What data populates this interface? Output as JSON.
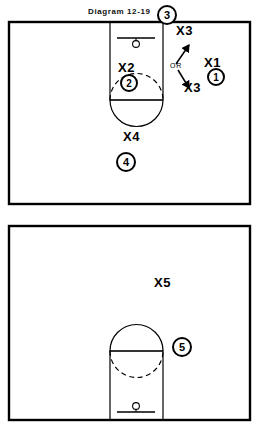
{
  "diagram": {
    "title": "Diagram 12-19",
    "type": "basketball-play-diagram",
    "court": {
      "ink_color": "#000000",
      "background_color": "#ffffff",
      "halves": [
        {
          "name": "frontcourt-top",
          "basket": "top"
        },
        {
          "name": "backcourt-bottom",
          "basket": "bottom"
        }
      ]
    },
    "labels": {
      "or": "OR"
    },
    "defense_markers": [
      {
        "id": "X1",
        "label": "X1",
        "x": 205,
        "y": 55
      },
      {
        "id": "X2",
        "label": "X2",
        "x": 120,
        "y": 62
      },
      {
        "id": "X3-top",
        "label": "X3",
        "x": 178,
        "y": 24
      },
      {
        "id": "X3-bottom",
        "label": "X3",
        "x": 186,
        "y": 81
      },
      {
        "id": "X4",
        "label": "X4",
        "x": 124,
        "y": 130
      },
      {
        "id": "X5",
        "label": "X5",
        "x": 155,
        "y": 276
      }
    ],
    "offense_markers": [
      {
        "id": "O3",
        "label": "3",
        "x": 157,
        "y": 5
      },
      {
        "id": "O1",
        "label": "1",
        "x": 206,
        "y": 68
      },
      {
        "id": "O2",
        "label": "2",
        "x": 120,
        "y": 76
      },
      {
        "id": "O4",
        "label": "4",
        "x": 117,
        "y": 152
      },
      {
        "id": "O5",
        "label": "5",
        "x": 172,
        "y": 337
      }
    ],
    "arrows": [
      {
        "id": "arrow-up-to-x3-top",
        "from": [
          176,
          64
        ],
        "to": [
          189,
          44
        ]
      },
      {
        "id": "arrow-down-to-x3-bottom",
        "from": [
          178,
          71
        ],
        "to": [
          190,
          89
        ]
      }
    ]
  }
}
